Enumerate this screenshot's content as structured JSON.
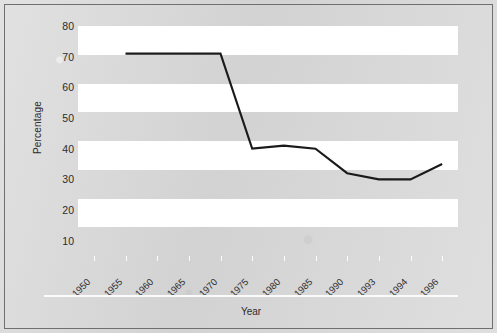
{
  "chart_data": {
    "type": "line",
    "title": "",
    "xlabel": "Year",
    "ylabel": "Percentage",
    "categories": [
      "1950",
      "1955",
      "1960",
      "1965",
      "1970",
      "1975",
      "1980",
      "1985",
      "1990",
      "1993",
      "1994",
      "1996"
    ],
    "values": [
      null,
      71,
      71,
      71,
      71,
      40,
      41,
      40,
      32,
      30,
      30,
      35
    ],
    "series": [
      {
        "name": "Percentage",
        "points": [
          {
            "x": "1950",
            "y": null
          },
          {
            "x": "1955",
            "y": 71
          },
          {
            "x": "1960",
            "y": 71
          },
          {
            "x": "1965",
            "y": 71
          },
          {
            "x": "1970",
            "y": 71
          },
          {
            "x": "1975",
            "y": 40
          },
          {
            "x": "1980",
            "y": 41
          },
          {
            "x": "1985",
            "y": 40
          },
          {
            "x": "1990",
            "y": 32
          },
          {
            "x": "1993",
            "y": 30
          },
          {
            "x": "1994",
            "y": 30
          },
          {
            "x": "1996",
            "y": 35
          }
        ],
        "color": "#1a1a1a"
      }
    ],
    "ylim": [
      5,
      80
    ],
    "yticks": [
      80,
      70,
      60,
      50,
      40,
      30,
      20,
      10
    ],
    "ytick_labels": [
      "80",
      "70",
      "60",
      "50",
      "40",
      "30",
      "20",
      "10"
    ],
    "grid": "horizontal-bands",
    "legend": "none",
    "band_colors": {
      "light": "#ffffff",
      "dark": "#d9d9d9"
    },
    "background": "#d9d9d9",
    "axis_text_color": "#2b2b2b"
  },
  "axes": {
    "y_title": "Percentage",
    "x_title": "Year"
  }
}
